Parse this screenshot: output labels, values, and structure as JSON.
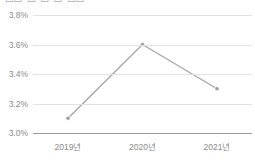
{
  "chart_data": {
    "type": "line",
    "title": "□□ □ □ □ □□",
    "title_note": "Korean heading clipped by the top edge of the screenshot; glyphs illegible",
    "xlabel": "",
    "ylabel": "",
    "categories": [
      "2019년",
      "2020년",
      "2021년"
    ],
    "values": [
      3.1,
      3.6,
      3.3
    ],
    "point_labels": [
      "3.1%",
      "3.6%",
      "3.3%"
    ],
    "ylim": [
      3.0,
      3.8
    ],
    "yticks": [
      3.0,
      3.2,
      3.4,
      3.6,
      3.8
    ],
    "ytick_labels": [
      "3.0%",
      "3.2%",
      "3.4%",
      "3.6%",
      "3.8%"
    ],
    "grid": true,
    "legend": false,
    "legend_position": "none",
    "series": [
      {
        "name": "",
        "values": [
          3.1,
          3.6,
          3.3
        ]
      }
    ],
    "colors": {
      "line": "#a6a6a6",
      "marker": "#9c9c9c",
      "gridline": "#e2e2e2",
      "axis": "#9a9a9a",
      "tick_label": "#8a8a8a",
      "title": "#8d8d8d",
      "background": "#ffffff"
    }
  }
}
